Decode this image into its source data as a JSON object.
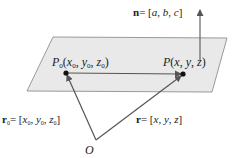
{
  "diagram": {
    "type": "vector-plane-equation",
    "colors": {
      "plane_fill": "#e9e9e9",
      "plane_stroke": "#9a9a9a",
      "arrow": "#555555",
      "point": "#111111",
      "text": "#222222"
    },
    "normal": {
      "vec": "n",
      "eq": "= [",
      "a": "a",
      "b": "b",
      "c": "c",
      "close": "]"
    },
    "p0": {
      "P": "P",
      "sub": "0",
      "open": "(",
      "x": "x",
      "y": "y",
      "z": "z",
      "close": ")"
    },
    "p": {
      "text_P": "P",
      "open": "(",
      "x": "x",
      "y": "y",
      "z": "z",
      "close": ")"
    },
    "r0": {
      "vec": "r",
      "sub": "0",
      "eq": "= [",
      "x": "x",
      "y": "y",
      "z": "z",
      "close": "]"
    },
    "r": {
      "vec": "r",
      "eq": "= [",
      "x": "x",
      "y": "y",
      "z": "z",
      "close": "]"
    },
    "origin": {
      "label": "O"
    },
    "sep": ", "
  }
}
